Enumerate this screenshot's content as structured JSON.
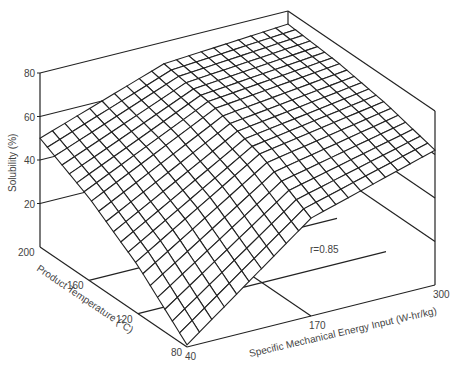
{
  "chart_data": {
    "type": "surface",
    "title": "",
    "zlabel": "Solubility  (%)",
    "xlabel": "Specific  Mechanical  Energy Input (W-hr/kg)",
    "ylabel": "Product  Temperature  (°C)",
    "annotation": "r=0.85",
    "z_ticks": [
      "20",
      "40",
      "60",
      "80"
    ],
    "x_ticks": [
      "40",
      "170",
      "300"
    ],
    "y_ticks": [
      "80",
      "120",
      "160",
      "200"
    ],
    "zlim": [
      0,
      80
    ],
    "xlim": [
      40,
      300
    ],
    "ylim": [
      80,
      200
    ],
    "grid_lines": 21,
    "corner_values": {
      "T200_E40": 50,
      "T200_E300": 74,
      "T80_E300": 62,
      "T80_E40": 1
    },
    "sample_grid": {
      "T": [
        80,
        120,
        160,
        200
      ],
      "E": [
        40,
        170,
        300
      ],
      "solubility": [
        [
          1,
          45,
          62
        ],
        [
          22,
          58,
          68
        ],
        [
          38,
          66,
          72
        ],
        [
          50,
          70,
          74
        ]
      ]
    }
  }
}
